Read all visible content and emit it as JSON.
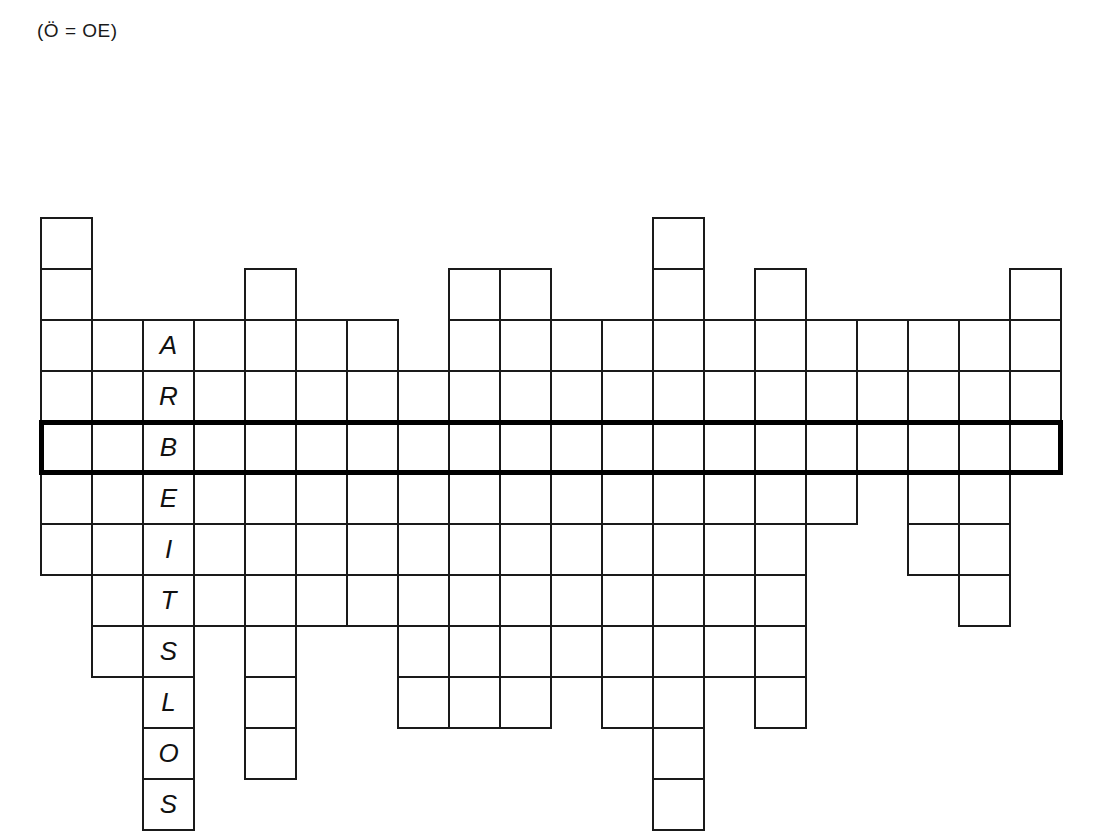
{
  "note": "(Ö = OE)",
  "puzzle": {
    "type": "crossword-skeleton",
    "keyword": "ARBEITSLOS",
    "keyword_column": 3,
    "keyword_start_row": 3,
    "highlight_row": 5,
    "highlight_letter": "B",
    "columns": 20,
    "rows": 12,
    "cell_size": 51,
    "origin_x": 40,
    "origin_y": 217,
    "letters": [
      {
        "row": 3,
        "col": 3,
        "ch": "A"
      },
      {
        "row": 4,
        "col": 3,
        "ch": "R"
      },
      {
        "row": 5,
        "col": 3,
        "ch": "B"
      },
      {
        "row": 6,
        "col": 3,
        "ch": "E"
      },
      {
        "row": 7,
        "col": 3,
        "ch": "I"
      },
      {
        "row": 8,
        "col": 3,
        "ch": "T"
      },
      {
        "row": 9,
        "col": 3,
        "ch": "S"
      },
      {
        "row": 10,
        "col": 3,
        "ch": "L"
      },
      {
        "row": 11,
        "col": 3,
        "ch": "O"
      },
      {
        "row": 12,
        "col": 3,
        "ch": "S"
      }
    ],
    "column_spans": [
      {
        "col": 1,
        "from": 1,
        "to": 7
      },
      {
        "col": 2,
        "from": 3,
        "to": 9
      },
      {
        "col": 3,
        "from": 3,
        "to": 12
      },
      {
        "col": 4,
        "from": 3,
        "to": 8
      },
      {
        "col": 5,
        "from": 2,
        "to": 11
      },
      {
        "col": 6,
        "from": 3,
        "to": 8
      },
      {
        "col": 7,
        "from": 3,
        "to": 8
      },
      {
        "col": 8,
        "from": 4,
        "to": 10
      },
      {
        "col": 9,
        "from": 2,
        "to": 10
      },
      {
        "col": 10,
        "from": 2,
        "to": 10
      },
      {
        "col": 11,
        "from": 3,
        "to": 9
      },
      {
        "col": 12,
        "from": 3,
        "to": 10
      },
      {
        "col": 13,
        "from": 1,
        "to": 12
      },
      {
        "col": 14,
        "from": 3,
        "to": 9
      },
      {
        "col": 15,
        "from": 2,
        "to": 10
      },
      {
        "col": 16,
        "from": 3,
        "to": 6
      },
      {
        "col": 17,
        "from": 3,
        "to": 5
      },
      {
        "col": 18,
        "from": 3,
        "to": 7
      },
      {
        "col": 19,
        "from": 3,
        "to": 8
      },
      {
        "col": 20,
        "from": 2,
        "to": 5
      }
    ],
    "extra_cells": [
      {
        "row": 1,
        "col": 13
      },
      {
        "row": 2,
        "col": 13
      },
      {
        "row": 1,
        "col": 1
      },
      {
        "row": 2,
        "col": 1
      }
    ]
  }
}
